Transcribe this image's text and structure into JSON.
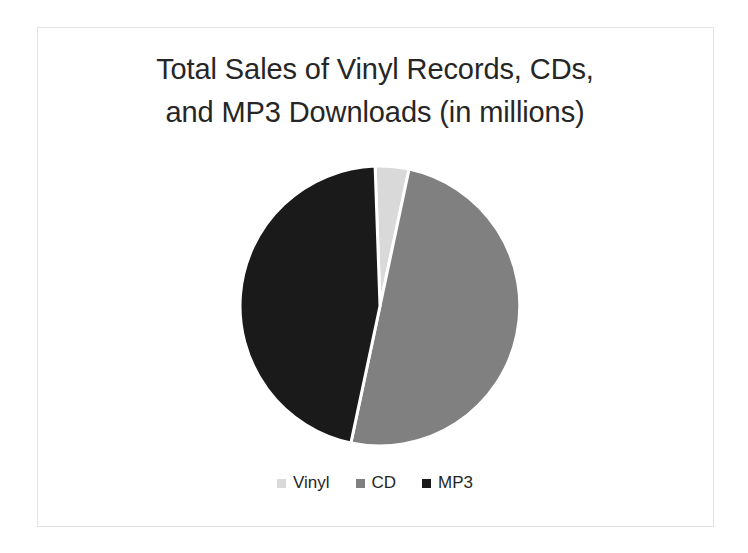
{
  "chart_data": {
    "type": "pie",
    "title": "Total Sales of Vinyl Records, CDs,\nand MP3 Downloads (in millions)",
    "title_line_1": "Total Sales of Vinyl Records, CDs,",
    "title_line_2": "and MP3 Downloads (in millions)",
    "categories": [
      "Vinyl",
      "CD",
      "MP3"
    ],
    "values": [
      4,
      50,
      46
    ],
    "value_unit": "percent of total",
    "slice_angles_deg": [
      14,
      180,
      166
    ],
    "start_angle_deg": -2,
    "colors": [
      "#d9d9d9",
      "#808080",
      "#1a1a1a"
    ],
    "legend": {
      "position": "bottom",
      "entries": [
        {
          "label": "Vinyl",
          "color": "#d9d9d9"
        },
        {
          "label": "CD",
          "color": "#808080"
        },
        {
          "label": "MP3",
          "color": "#1a1a1a"
        }
      ]
    },
    "data_labels": false,
    "grid": false,
    "xlabel": "",
    "ylabel": ""
  },
  "slide": {
    "background_color": "#ffffff",
    "frame_color": "#e3e3e3",
    "title_color": "#262626"
  },
  "geometry": {
    "center_x": 155,
    "center_y": 154,
    "radius": 140,
    "separator_color": "#ffffff",
    "separator_width": 3
  }
}
